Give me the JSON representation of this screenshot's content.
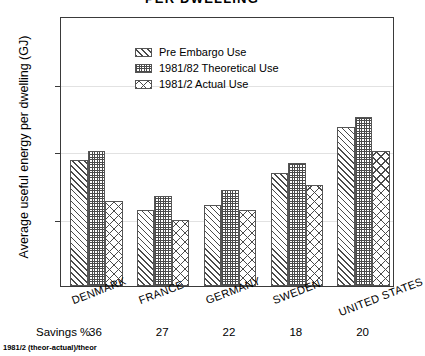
{
  "chart_data": {
    "type": "bar",
    "title": "PER DWELLING",
    "xlabel": "",
    "ylabel": "Average useful energy per dwelling (GJ)",
    "ylim": [
      0,
      200
    ],
    "yticks": [
      0,
      50,
      100,
      150,
      200
    ],
    "grid": true,
    "legend_position": "upper-left-inside",
    "categories": [
      "DENMARK",
      "FRANCE",
      "GERMANY",
      "SWEDEN",
      "UNITED STATES"
    ],
    "series": [
      {
        "name": "Pre Embargo Use",
        "pattern": "diagonal-hatch",
        "values": [
          93,
          56,
          60,
          84,
          118
        ]
      },
      {
        "name": "1981/82 Theoretical Use",
        "pattern": "fine-checker",
        "values": [
          100,
          67,
          71,
          91,
          125
        ]
      },
      {
        "name": "1981/2 Actual Use",
        "pattern": "cross-hatch",
        "values": [
          63,
          49,
          56,
          75,
          100
        ]
      }
    ],
    "annotations": {
      "savings_label": "Savings %",
      "savings_values": [
        36,
        27,
        22,
        18,
        20
      ],
      "footnote": "1981/2 (theor-actual)/theor"
    }
  },
  "colors": {
    "background": "#ffffff",
    "axis": "#3a3a3a",
    "grid": "#e2e2e2",
    "ink": "#000000",
    "hatch": "#4a4a4a"
  }
}
